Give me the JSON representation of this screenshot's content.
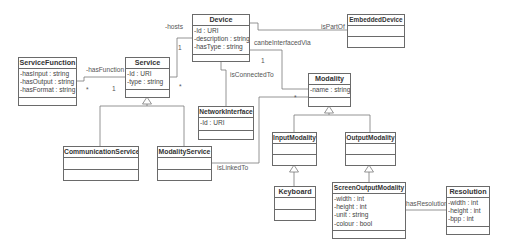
{
  "diagram": {
    "type": "uml-class-diagram",
    "classes": {
      "device": {
        "name": "Device",
        "attributes": [
          "-Id : URI",
          "-description : string",
          "-hasType : string"
        ]
      },
      "embedded_device": {
        "name": "EmbeddedDevice",
        "attributes": []
      },
      "service_function": {
        "name": "ServiceFunction",
        "attributes": [
          "-hasInput : string",
          "-hasOutput : string",
          "-hasFormat : string"
        ]
      },
      "service": {
        "name": "Service",
        "attributes": [
          "-Id : URI",
          "-type : string"
        ]
      },
      "modality": {
        "name": "Modality",
        "attributes": [
          "-name : string"
        ]
      },
      "network_interface": {
        "name": "NetworkInterface",
        "attributes": [
          "-Id : URI"
        ]
      },
      "communication_service": {
        "name": "CommunicationService",
        "attributes": []
      },
      "modality_service": {
        "name": "ModalityService",
        "attributes": []
      },
      "input_modality": {
        "name": "InputModality",
        "attributes": []
      },
      "output_modality": {
        "name": "OutputModality",
        "attributes": []
      },
      "keyboard": {
        "name": "Keyboard",
        "attributes": []
      },
      "screen_output_modality": {
        "name": "ScreenOutputModality",
        "attributes": [
          "-width : int",
          "-height : int",
          "-unit : string",
          "-colour : bool"
        ]
      },
      "resolution": {
        "name": "Resolution",
        "attributes": [
          "-width : int",
          "-height : int",
          "-bpp : int"
        ]
      }
    },
    "associations": {
      "hosts": {
        "label": "-hosts",
        "from": "Service",
        "to": "Device",
        "mult_device": "1",
        "mult_service": "*"
      },
      "has_function": {
        "label": "-hasFunction",
        "from": "Service",
        "to": "ServiceFunction",
        "mult_function": "*",
        "mult_service": "1"
      },
      "is_part_of": {
        "label": "isPartOf",
        "from": "Device",
        "to": "EmbeddedDevice"
      },
      "can_be_interfaced_via": {
        "label": "canbeInterfacedVia",
        "from": "Device",
        "to": "Modality",
        "mult_device": "1"
      },
      "is_connected_to": {
        "label": "isConnectedTo",
        "from": "Device",
        "to": "NetworkInterface"
      },
      "is_linked_to": {
        "label": "isLinkedTo",
        "from": "ModalityService",
        "to": "Modality",
        "mult_modality": "*"
      },
      "has_resolution": {
        "label": "hasResolution",
        "from": "ScreenOutputModality",
        "to": "Resolution"
      }
    },
    "generalizations": [
      {
        "parent": "Service",
        "children": [
          "CommunicationService",
          "ModalityService"
        ]
      },
      {
        "parent": "Modality",
        "children": [
          "InputModality",
          "OutputModality"
        ]
      },
      {
        "parent": "InputModality",
        "children": [
          "Keyboard"
        ]
      },
      {
        "parent": "OutputModality",
        "children": [
          "ScreenOutputModality"
        ]
      }
    ],
    "colors": {
      "line": "#6a6a6a",
      "text": "#333333",
      "background": "#ffffff"
    }
  }
}
